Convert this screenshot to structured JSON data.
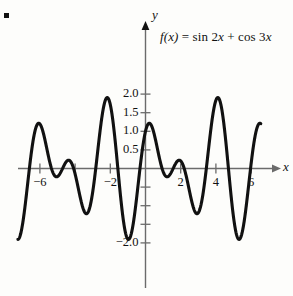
{
  "figure": {
    "bullet": "square-bullet",
    "function_label": {
      "lhs": "f(x)",
      "equals": "=",
      "rhs": "sin 2x + cos 3x",
      "full": "f(x) = sin 2x + cos 3x"
    },
    "axis_labels": {
      "x": "x",
      "y": "y"
    },
    "colors": {
      "curve": "#111111",
      "axis": "#6b6b6b",
      "text": "#111111",
      "background": "#fdfdfb"
    }
  },
  "chart_data": {
    "type": "line",
    "title": "",
    "subtitle": "",
    "xlabel": "x",
    "ylabel": "y",
    "expression": "sin(2*x) + cos(3*x)",
    "annotations": [
      "f(x) = sin 2x + cos 3x"
    ],
    "legend_position": "none",
    "grid": false,
    "xlim": [
      -7.3,
      6.8
    ],
    "ylim": [
      -2.35,
      2.25
    ],
    "x_ticks": [
      -6,
      -4,
      -2,
      2,
      4,
      6
    ],
    "x_tick_labels": [
      "-6",
      "",
      "-2",
      "2",
      "4",
      "6"
    ],
    "y_ticks": [
      -2.0,
      -1.5,
      -1.0,
      -0.5,
      0.5,
      1.0,
      1.5,
      2.0
    ],
    "y_tick_labels": [
      "-2.0",
      "",
      "",
      "",
      "0.5",
      "1.0",
      "1.5",
      "2.0"
    ],
    "x_domain_drawn": [
      -7.25,
      6.55
    ],
    "series": [
      {
        "name": "f(x) = sin 2x + cos 3x",
        "color": "#111111",
        "x": [
          -7.25,
          -7.0,
          -6.75,
          -6.5,
          -6.25,
          -6.0,
          -5.75,
          -5.5,
          -5.25,
          -5.0,
          -4.75,
          -4.5,
          -4.25,
          -4.0,
          -3.75,
          -3.5,
          -3.25,
          -3.0,
          -2.75,
          -2.5,
          -2.25,
          -2.0,
          -1.75,
          -1.5,
          -1.25,
          -1.0,
          -0.75,
          -0.5,
          -0.25,
          0.0,
          0.25,
          0.5,
          0.75,
          1.0,
          1.25,
          1.5,
          1.75,
          2.0,
          2.25,
          2.5,
          2.75,
          3.0,
          3.25,
          3.5,
          3.75,
          4.0,
          4.25,
          4.5,
          4.75,
          5.0,
          5.25,
          5.5,
          5.75,
          6.0,
          6.25,
          6.55
        ],
        "y": [
          -1.66,
          -0.45,
          0.6,
          1.21,
          1.14,
          0.52,
          -0.22,
          -0.63,
          -0.49,
          0.02,
          0.45,
          0.42,
          -0.13,
          -0.86,
          -1.28,
          -1.06,
          -0.22,
          0.7,
          1.29,
          1.37,
          1.13,
          0.7,
          0.03,
          -0.94,
          -1.81,
          -2.07,
          -1.47,
          -0.47,
          0.29,
          1.0,
          1.19,
          0.31,
          -0.98,
          -1.08,
          0.27,
          1.38,
          0.82,
          -0.2,
          0.11,
          0.92,
          0.67,
          -0.71,
          -1.86,
          -1.8,
          -0.45,
          1.08,
          1.68,
          1.08,
          -0.21,
          -1.32,
          -1.83,
          -1.6,
          -0.86,
          0.02,
          0.77,
          1.18
        ]
      }
    ]
  }
}
